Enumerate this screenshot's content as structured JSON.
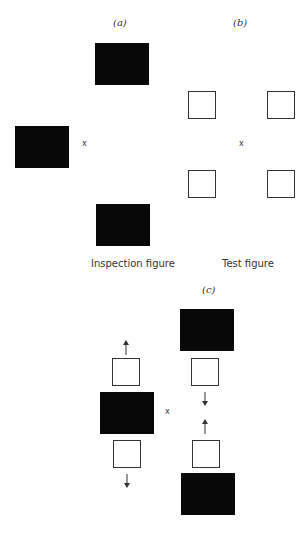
{
  "panel_a": {
    "label": "(a)",
    "caption": "Inspection figure",
    "fixation": "x"
  },
  "panel_b": {
    "label": "(b)",
    "caption": "Test figure",
    "fixation": "x"
  },
  "panel_c": {
    "label": "(c)",
    "fixation": "x"
  },
  "colors": {
    "filled": "#080808",
    "outline": "#333333",
    "background": "#ffffff"
  }
}
